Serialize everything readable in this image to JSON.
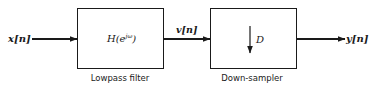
{
  "diagram": {
    "type": "block-diagram",
    "input": {
      "label": "x[n]"
    },
    "blocks": [
      {
        "id": "lowpass",
        "content": "H(e",
        "superscript": "jω",
        "content_close": ")",
        "caption": "Lowpass filter"
      },
      {
        "id": "downsampler",
        "content": "D",
        "symbol": "down-arrow",
        "caption": "Down-sampler"
      }
    ],
    "intermediate": {
      "label": "v[n]"
    },
    "output": {
      "label": "y[n]"
    },
    "colors": {
      "stroke": "#1a1a1a",
      "background": "#ffffff"
    }
  }
}
